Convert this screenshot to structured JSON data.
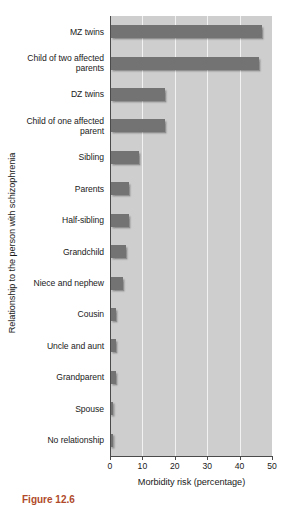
{
  "chart_data": {
    "type": "bar",
    "orientation": "horizontal",
    "title": "",
    "xlabel": "Morbidity risk (percentage)",
    "ylabel": "Relationship to the person with schizophrenia",
    "xlim": [
      0,
      50
    ],
    "xticks": [
      0,
      10,
      20,
      30,
      40,
      50
    ],
    "xtick_labels": [
      "0",
      "10",
      "20",
      "30",
      "40",
      "50"
    ],
    "grid": true,
    "grid_axis": "x",
    "legend": null,
    "categories": [
      "MZ twins",
      "Child of two affected parents",
      "DZ twins",
      "Child of one affected parent",
      "Sibling",
      "Parents",
      "Half-sibling",
      "Grandchild",
      "Niece and nephew",
      "Cousin",
      "Uncle and aunt",
      "Grandparent",
      "Spouse",
      "No relationship"
    ],
    "values": [
      47,
      46,
      17,
      17,
      9,
      6,
      6,
      5,
      4,
      2,
      2,
      2,
      1,
      1
    ],
    "colors": {
      "bar": "#737373",
      "plot_background": "#cecece",
      "gridline": "#f2f2f2",
      "axis": "#4a4a4a",
      "text": "#1a1a1a",
      "caption": "#b04a2a"
    }
  },
  "axis": {
    "y_title": "Relationship to the person with schizophrenia",
    "x_title": "Morbidity risk (percentage)"
  },
  "caption": {
    "text": "Figure 12.6"
  }
}
